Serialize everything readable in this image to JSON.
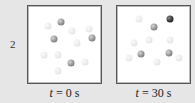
{
  "row_label": "2",
  "panels": [
    {
      "caption_var": "t",
      "caption_rest": " = 0 s",
      "left": 27,
      "balls": [
        {
          "x": 20,
          "y": 20,
          "kind": "light"
        },
        {
          "x": 33,
          "y": 16,
          "kind": "gray"
        },
        {
          "x": 44,
          "y": 25,
          "kind": "light"
        },
        {
          "x": 61,
          "y": 23,
          "kind": "light"
        },
        {
          "x": 26,
          "y": 33,
          "kind": "gray"
        },
        {
          "x": 49,
          "y": 37,
          "kind": "light"
        },
        {
          "x": 64,
          "y": 32,
          "kind": "gray"
        },
        {
          "x": 16,
          "y": 49,
          "kind": "light"
        },
        {
          "x": 30,
          "y": 49,
          "kind": "light"
        },
        {
          "x": 43,
          "y": 57,
          "kind": "gray"
        },
        {
          "x": 57,
          "y": 56,
          "kind": "light"
        },
        {
          "x": 30,
          "y": 65,
          "kind": "light"
        }
      ]
    },
    {
      "caption_var": "t",
      "caption_rest": " = 30 s",
      "left": 116,
      "balls": [
        {
          "x": 22,
          "y": 13,
          "kind": "light"
        },
        {
          "x": 53,
          "y": 13,
          "kind": "dark"
        },
        {
          "x": 37,
          "y": 21,
          "kind": "gray"
        },
        {
          "x": 17,
          "y": 37,
          "kind": "light"
        },
        {
          "x": 32,
          "y": 34,
          "kind": "light"
        },
        {
          "x": 53,
          "y": 34,
          "kind": "light"
        },
        {
          "x": 12,
          "y": 52,
          "kind": "light"
        },
        {
          "x": 24,
          "y": 48,
          "kind": "gray"
        },
        {
          "x": 52,
          "y": 47,
          "kind": "gray"
        },
        {
          "x": 62,
          "y": 52,
          "kind": "light"
        },
        {
          "x": 40,
          "y": 56,
          "kind": "light"
        }
      ]
    }
  ]
}
